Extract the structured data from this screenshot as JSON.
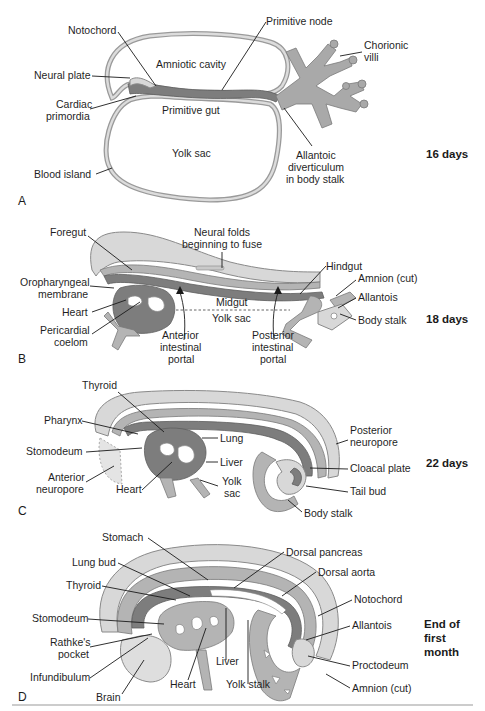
{
  "figure": {
    "panels": [
      {
        "id": "A",
        "letter": "A",
        "stage": "16 days",
        "labels": {
          "notochord": "Notochord",
          "primitive_node": "Primitive node",
          "chorionic_villi_1": "Chorionic",
          "chorionic_villi_2": "villi",
          "amniotic_cavity": "Amniotic cavity",
          "neural_plate": "Neural plate",
          "cardiac_primordia_1": "Cardiac",
          "cardiac_primordia_2": "primordia",
          "primitive_gut": "Primitive gut",
          "yolk_sac": "Yolk sac",
          "blood_island": "Blood island",
          "allantoic_1": "Allantoic",
          "allantoic_2": "diverticulum",
          "allantoic_3": "in body stalk"
        }
      },
      {
        "id": "B",
        "letter": "B",
        "stage": "18 days",
        "labels": {
          "foregut": "Foregut",
          "neural_folds_1": "Neural folds",
          "neural_folds_2": "beginning to fuse",
          "oropharyngeal_1": "Oropharyngeal",
          "oropharyngeal_2": "membrane",
          "heart": "Heart",
          "pericardial_1": "Pericardial",
          "pericardial_2": "coelom",
          "midgut": "Midgut",
          "yolk_sac": "Yolk sac",
          "anterior_portal_1": "Anterior",
          "anterior_portal_2": "intestinal",
          "anterior_portal_3": "portal",
          "posterior_portal_1": "Posterior",
          "posterior_portal_2": "intestinal",
          "posterior_portal_3": "portal",
          "hindgut": "Hindgut",
          "amnion_cut": "Amnion (cut)",
          "allantois": "Allantois",
          "body_stalk": "Body stalk"
        }
      },
      {
        "id": "C",
        "letter": "C",
        "stage": "22 days",
        "labels": {
          "thyroid": "Thyroid",
          "pharynx": "Pharynx",
          "stomodeum": "Stomodeum",
          "anterior_neuropore_1": "Anterior",
          "anterior_neuropore_2": "neuropore",
          "heart": "Heart",
          "lung": "Lung",
          "liver": "Liver",
          "yolk_sac_1": "Yolk",
          "yolk_sac_2": "sac",
          "posterior_neuropore_1": "Posterior",
          "posterior_neuropore_2": "neuropore",
          "cloacal_plate": "Cloacal plate",
          "tail_bud": "Tail bud",
          "body_stalk": "Body stalk"
        }
      },
      {
        "id": "D",
        "letter": "D",
        "stage_lines": [
          "End of",
          "first",
          "month"
        ],
        "labels": {
          "stomach": "Stomach",
          "lung_bud": "Lung bud",
          "thyroid": "Thyroid",
          "stomodeum": "Stomodeum",
          "rathkes_1": "Rathke's",
          "rathkes_2": "pocket",
          "infundibulum": "Infundibulum",
          "brain": "Brain",
          "heart": "Heart",
          "liver": "Liver",
          "yolk_stalk": "Yolk stalk",
          "dorsal_pancreas": "Dorsal pancreas",
          "dorsal_aorta": "Dorsal aorta",
          "notochord": "Notochord",
          "allantois": "Allantois",
          "proctodeum": "Proctodeum",
          "amnion_cut": "Amnion (cut)"
        }
      }
    ]
  }
}
